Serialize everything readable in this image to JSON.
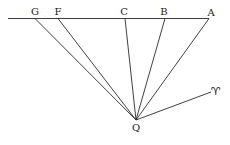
{
  "diagram": {
    "type": "geometric-construction",
    "baseline": {
      "x1": 8,
      "y1": 18.5,
      "x2": 209,
      "y2": 18.5
    },
    "apex": {
      "name": "Q",
      "x": 136,
      "y": 120,
      "label_x": 136,
      "label_y": 131
    },
    "points": [
      {
        "name": "G",
        "x": 35,
        "y": 18.5,
        "label_x": 35,
        "label_y": 15
      },
      {
        "name": "F",
        "x": 58,
        "y": 18.5,
        "label_x": 58,
        "label_y": 15
      },
      {
        "name": "C",
        "x": 125,
        "y": 18.5,
        "label_x": 124,
        "label_y": 15
      },
      {
        "name": "B",
        "x": 165,
        "y": 18.5,
        "label_x": 164,
        "label_y": 15
      },
      {
        "name": "A",
        "x": 209,
        "y": 18.5,
        "label_x": 211,
        "label_y": 16
      }
    ],
    "aries": {
      "symbol": "♈",
      "name": "aries-symbol",
      "line_x": 211,
      "line_y": 92,
      "label_x": 216,
      "label_y": 95
    }
  },
  "labels": {
    "G": "G",
    "F": "F",
    "C": "C",
    "B": "B",
    "A": "A",
    "Q": "Q",
    "aries": "♈"
  }
}
